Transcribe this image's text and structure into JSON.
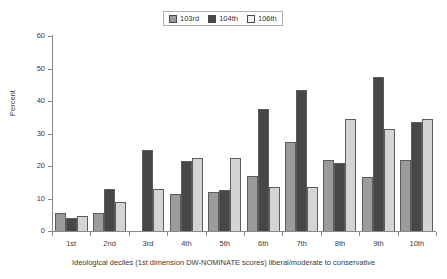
{
  "chart_data": {
    "type": "bar",
    "title": "",
    "xlabel": "Ideological deciles (1st dimension DW-NOMINATE scores) liberal/moderate to conservative",
    "ylabel": "Percent",
    "ylim": [
      0,
      60
    ],
    "ytick_step": 10,
    "yticks": [
      0,
      10,
      20,
      30,
      40,
      50,
      60
    ],
    "grid": false,
    "legend_position": "top-center",
    "categories": [
      "1st",
      "2nd",
      "3rd",
      "4th",
      "5th",
      "6th",
      "7th",
      "8th",
      "9th",
      "10th"
    ],
    "series": [
      {
        "name": "103rd",
        "color": "#9b9b9b",
        "values": [
          5.5,
          5.5,
          0,
          11.5,
          12,
          17,
          27.5,
          22,
          16.5,
          22
        ]
      },
      {
        "name": "104th",
        "color": "#474747",
        "values": [
          4,
          13,
          25,
          21.5,
          12.5,
          37.5,
          43.5,
          21,
          47.5,
          33.5
        ]
      },
      {
        "name": "106th",
        "color": "#d4d4d4",
        "values": [
          4.5,
          9,
          13,
          22.5,
          22.5,
          13.5,
          13.5,
          34.5,
          31.5,
          34.5
        ]
      }
    ]
  }
}
